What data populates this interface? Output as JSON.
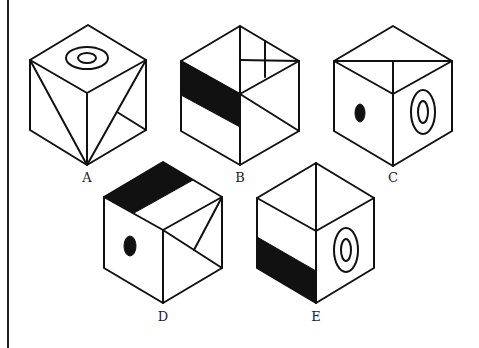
{
  "figure": {
    "type": "cube-options-puzzle",
    "colors": {
      "line": "#111111",
      "fill": "#111111",
      "background": "#ffffff"
    },
    "options": [
      {
        "id": "A",
        "label": "A",
        "top_face": "concentric-circles",
        "left_face": "diagonal-line",
        "right_face": "diagonal-line-with-branch"
      },
      {
        "id": "B",
        "label": "B",
        "top_face": "vertical-line-with-cross",
        "left_face": "black-band",
        "right_face": "diagonal-line"
      },
      {
        "id": "C",
        "label": "C",
        "top_face": "T-lines",
        "left_face": "black-dot",
        "right_face": "concentric-ovals"
      },
      {
        "id": "D",
        "label": "D",
        "top_face": "black-band",
        "left_face": "black-dot",
        "right_face": "diagonal-with-branch"
      },
      {
        "id": "E",
        "label": "E",
        "top_face": "vertical-line",
        "left_face": "black-band-bottom",
        "right_face": "concentric-ovals"
      }
    ]
  }
}
